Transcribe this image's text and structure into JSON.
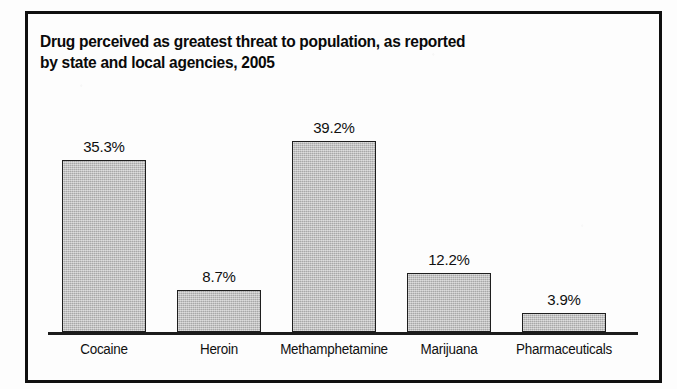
{
  "figure": {
    "title_line1": "Drug perceived as greatest threat to population, as reported",
    "title_line2": "by state and local agencies, 2005",
    "frame_color": "#101010",
    "bar_fill_color": "#b9b9b9",
    "bar_outline_color": "#1e1e1e",
    "axis_color": "#1c1c1c",
    "background_color": "#fdfdfd"
  },
  "chart_data": {
    "type": "bar",
    "title": "Drug perceived as greatest threat to population, as reported by state and local agencies, 2005",
    "xlabel": "",
    "ylabel": "",
    "ylim": [
      0,
      43.5
    ],
    "grid": false,
    "legend": "none",
    "categories": [
      "Cocaine",
      "Heroin",
      "Methamphetamine",
      "Marijuana",
      "Pharmaceuticals"
    ],
    "values": [
      35.3,
      8.7,
      39.2,
      12.2,
      3.9
    ],
    "value_labels": [
      "35.3%",
      "8.7%",
      "39.2%",
      "12.2%",
      "3.9%"
    ],
    "units": "percent"
  }
}
